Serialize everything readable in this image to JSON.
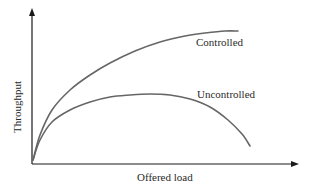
{
  "chart_data": {
    "type": "line",
    "title": "",
    "xlabel": "Offered load",
    "ylabel": "Throughput",
    "grid": false,
    "legend": "inline labels",
    "axis_ticks": "none",
    "series": [
      {
        "name": "Controlled",
        "description": "Throughput rises with offered load and saturates at a high plateau",
        "points_px": [
          [
            33,
            160
          ],
          [
            40,
            135
          ],
          [
            52,
            110
          ],
          [
            70,
            90
          ],
          [
            90,
            75
          ],
          [
            110,
            63
          ],
          [
            135,
            51
          ],
          [
            160,
            42
          ],
          [
            185,
            36
          ],
          [
            205,
            33
          ],
          [
            225,
            31
          ],
          [
            238,
            31
          ]
        ]
      },
      {
        "name": "Uncontrolled",
        "description": "Throughput rises, peaks at a lower level, then collapses as load increases",
        "points_px": [
          [
            33,
            160
          ],
          [
            40,
            140
          ],
          [
            52,
            122
          ],
          [
            70,
            110
          ],
          [
            90,
            102
          ],
          [
            110,
            97
          ],
          [
            130,
            95
          ],
          [
            150,
            94
          ],
          [
            170,
            95
          ],
          [
            190,
            99
          ],
          [
            210,
            107
          ],
          [
            228,
            120
          ],
          [
            242,
            134
          ],
          [
            250,
            146
          ]
        ]
      }
    ],
    "annotations": [
      {
        "text": "Controlled",
        "x": 196,
        "y": 46
      },
      {
        "text": "Uncontrolled",
        "x": 197,
        "y": 98
      }
    ]
  },
  "labels": {
    "y_axis": "Throughput",
    "x_axis": "Offered load",
    "controlled": "Controlled",
    "uncontrolled": "Uncontrolled"
  },
  "colors": {
    "axis": "#1a1a1a",
    "curve": "#666666",
    "text": "#2a2a2a"
  }
}
